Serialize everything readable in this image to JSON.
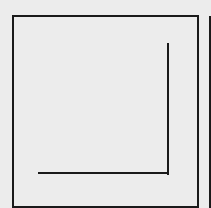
{
  "diagram": {
    "background_color": "#ececec",
    "stroke_color": "#1a1a1a",
    "shapes": [
      {
        "type": "rect",
        "name": "outer-square",
        "x": 13,
        "y": 16,
        "width": 184,
        "height": 190
      },
      {
        "type": "line",
        "name": "l-vertical-stroke",
        "x1": 168,
        "y1": 43,
        "x2": 168,
        "y2": 174
      },
      {
        "type": "line",
        "name": "l-horizontal-stroke",
        "x1": 38,
        "y1": 173,
        "x2": 169,
        "y2": 173
      },
      {
        "type": "line",
        "name": "right-edge-bar",
        "x1": 210,
        "y1": 16,
        "x2": 210,
        "y2": 208
      }
    ]
  }
}
